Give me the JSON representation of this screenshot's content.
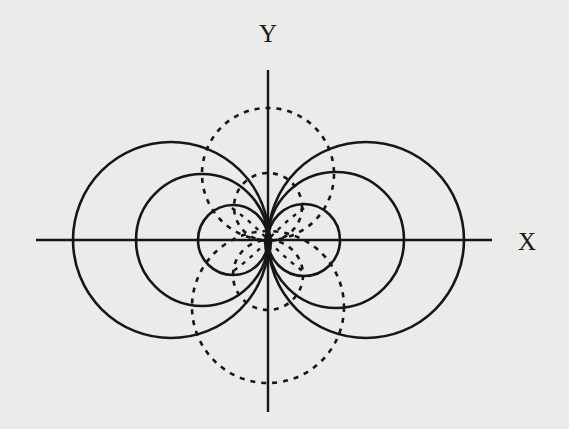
{
  "diagram": {
    "type": "field-lines",
    "labels": {
      "x_axis": "X",
      "y_axis": "Y"
    },
    "colors": {
      "background": "#ebebe9",
      "ink": "#161616"
    },
    "origin": [
      268,
      240
    ],
    "solid_circles": [
      {
        "cx": 171,
        "cy": 240,
        "r": 98
      },
      {
        "cx": 202,
        "cy": 240,
        "r": 66
      },
      {
        "cx": 233,
        "cy": 240,
        "r": 35
      },
      {
        "cx": 366,
        "cy": 240,
        "r": 98
      },
      {
        "cx": 336,
        "cy": 240,
        "r": 68
      },
      {
        "cx": 304,
        "cy": 240,
        "r": 36
      }
    ],
    "dashed_circles": [
      {
        "cx": 268,
        "cy": 174,
        "r": 66
      },
      {
        "cx": 268,
        "cy": 207,
        "r": 34
      },
      {
        "cx": 268,
        "cy": 307,
        "r": 76
      },
      {
        "cx": 268,
        "cy": 275,
        "r": 35
      }
    ]
  }
}
